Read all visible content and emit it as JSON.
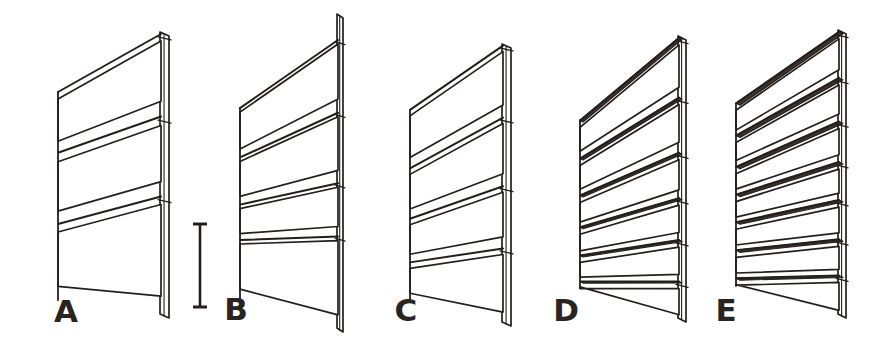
{
  "figure": {
    "background_color": "#ffffff",
    "ink_color": "#241f1c",
    "label_color": "#2a2420",
    "canvas": {
      "width": 896,
      "height": 343
    }
  },
  "scalebar": {
    "name": "scale-bar",
    "orientation": "vertical",
    "x": 200,
    "y_top": 224,
    "y_bottom": 307,
    "length_px": 83,
    "cap_half_width": 7,
    "line_width": 2.6,
    "caption": ""
  },
  "panels": [
    {
      "id": "A",
      "label": "A",
      "slat_count": 3,
      "label_x": 66,
      "label_y": 322,
      "post_x": 160,
      "post_width": 9,
      "post_top": 32,
      "post_bottom": 318,
      "left_x": 58,
      "left_top": 92,
      "left_bottom": 300,
      "slats": [
        {
          "left_y": 92,
          "right_y": 34,
          "height": 7,
          "depth": 0
        },
        {
          "left_y": 152,
          "right_y": 116,
          "height": 9,
          "depth": 0
        },
        {
          "left_y": 224,
          "right_y": 196,
          "height": 8,
          "depth": 0
        }
      ]
    },
    {
      "id": "B",
      "label": "B",
      "slat_count": 4,
      "label_x": 236,
      "label_y": 320,
      "post_x": 337,
      "post_width": 6,
      "post_top": 14,
      "post_bottom": 332,
      "left_x": 240,
      "left_top": 108,
      "left_bottom": 300,
      "slats": [
        {
          "left_y": 108,
          "right_y": 40,
          "height": 4,
          "depth": 0
        },
        {
          "left_y": 158,
          "right_y": 112,
          "height": 4,
          "depth": 0
        },
        {
          "left_y": 205,
          "right_y": 183,
          "height": 4,
          "depth": 0
        },
        {
          "left_y": 240,
          "right_y": 236,
          "height": 4,
          "depth": 0
        }
      ]
    },
    {
      "id": "C",
      "label": "C",
      "slat_count": 4,
      "label_x": 406,
      "label_y": 321,
      "post_x": 502,
      "post_width": 9,
      "post_top": 44,
      "post_bottom": 326,
      "left_x": 410,
      "left_top": 110,
      "left_bottom": 300,
      "slats": [
        {
          "left_y": 110,
          "right_y": 46,
          "height": 6,
          "depth": 0
        },
        {
          "left_y": 168,
          "right_y": 118,
          "height": 6,
          "depth": 0
        },
        {
          "left_y": 218,
          "right_y": 186,
          "height": 6,
          "depth": 0
        },
        {
          "left_y": 262,
          "right_y": 248,
          "height": 6,
          "depth": 0
        }
      ]
    },
    {
      "id": "D",
      "label": "D",
      "slat_count": 6,
      "label_x": 566,
      "label_y": 321,
      "post_x": 678,
      "post_width": 8,
      "post_top": 36,
      "post_bottom": 322,
      "left_x": 580,
      "left_top": 120,
      "left_bottom": 288,
      "slats": [
        {
          "left_y": 120,
          "right_y": 38,
          "height": 7,
          "depth": 3
        },
        {
          "left_y": 158,
          "right_y": 98,
          "height": 7,
          "depth": 3
        },
        {
          "left_y": 196,
          "right_y": 152,
          "height": 7,
          "depth": 3
        },
        {
          "left_y": 228,
          "right_y": 198,
          "height": 7,
          "depth": 3
        },
        {
          "left_y": 256,
          "right_y": 240,
          "height": 7,
          "depth": 3
        },
        {
          "left_y": 282,
          "right_y": 282,
          "height": 7,
          "depth": 3
        }
      ]
    },
    {
      "id": "E",
      "label": "E",
      "slat_count": 7,
      "label_x": 726,
      "label_y": 321,
      "post_x": 838,
      "post_width": 8,
      "post_top": 30,
      "post_bottom": 318,
      "left_x": 736,
      "left_top": 104,
      "left_bottom": 286,
      "slats": [
        {
          "left_y": 104,
          "right_y": 32,
          "height": 7,
          "depth": 4
        },
        {
          "left_y": 136,
          "right_y": 78,
          "height": 7,
          "depth": 4
        },
        {
          "left_y": 166,
          "right_y": 122,
          "height": 7,
          "depth": 4
        },
        {
          "left_y": 194,
          "right_y": 162,
          "height": 7,
          "depth": 4
        },
        {
          "left_y": 222,
          "right_y": 200,
          "height": 7,
          "depth": 4
        },
        {
          "left_y": 250,
          "right_y": 240,
          "height": 7,
          "depth": 4
        },
        {
          "left_y": 278,
          "right_y": 276,
          "height": 7,
          "depth": 4
        }
      ]
    }
  ]
}
